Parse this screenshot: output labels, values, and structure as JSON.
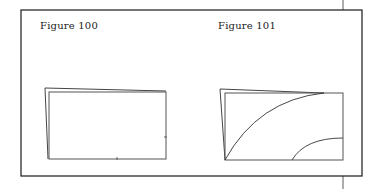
{
  "figures": [
    {
      "id": "figure-100",
      "label": "Figure 100",
      "label_pos": {
        "x": 40,
        "y": 20
      },
      "outer_quad": [
        [
          45,
          88
        ],
        [
          166,
          91
        ],
        [
          166,
          159
        ],
        [
          48,
          159
        ]
      ],
      "inner_rect": {
        "x": 49,
        "y": 92,
        "w": 117,
        "h": 67
      },
      "ticks": [
        {
          "x1": 117,
          "y1": 157,
          "x2": 117,
          "y2": 160
        },
        {
          "x1": 164,
          "y1": 137,
          "x2": 167,
          "y2": 137
        }
      ],
      "curves": []
    },
    {
      "id": "figure-101",
      "label": "Figure 101",
      "label_pos": {
        "x": 218,
        "y": 20
      },
      "outer_quad": [
        [
          220,
          89
        ],
        [
          324,
          93
        ],
        [
          343,
          93
        ],
        [
          343,
          160
        ],
        [
          225,
          160
        ]
      ],
      "inner_rect": {
        "x": 225,
        "y": 93,
        "w": 118,
        "h": 67
      },
      "ticks": [],
      "curves": [
        {
          "d": "M225,160 Q258,100 324,93"
        },
        {
          "d": "M292,160 Q305,138 343,138"
        }
      ]
    }
  ],
  "frame": {
    "x": 21,
    "y": 10,
    "w": 341,
    "h": 166,
    "connector_x": 343,
    "stroke": "#1a1a1a"
  },
  "colors": {
    "line": "#333333",
    "frame": "#1a1a1a",
    "background": "#ffffff"
  }
}
